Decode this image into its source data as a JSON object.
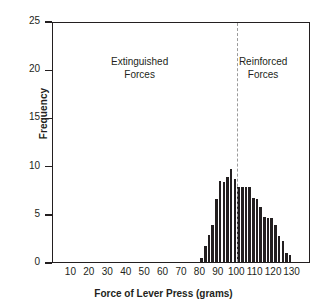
{
  "chart_data": {
    "type": "bar",
    "title": "",
    "xlabel": "Force of Lever Press (grams)",
    "ylabel": "Frequency",
    "xlim": [
      0,
      140
    ],
    "ylim": [
      0,
      25
    ],
    "grid": false,
    "legend": "none",
    "bar_color": "#231f20",
    "x_ticks": [
      10,
      20,
      30,
      40,
      50,
      60,
      70,
      80,
      90,
      100,
      110,
      120,
      130
    ],
    "x_tick_labels": [
      "10",
      "20",
      "30",
      "40",
      "50",
      "60",
      "70",
      "80",
      "90",
      "100",
      "110",
      "120",
      "130"
    ],
    "y_ticks": [
      0,
      5,
      10,
      15,
      20,
      25
    ],
    "y_tick_labels": [
      "0",
      "5",
      "10",
      "15",
      "20",
      "25"
    ],
    "bin_width": 2,
    "x": [
      81,
      83,
      85,
      87,
      89,
      91,
      93,
      95,
      97,
      99,
      101,
      103,
      105,
      107,
      109,
      111,
      113,
      115,
      117,
      119,
      121,
      123,
      125,
      127,
      129,
      131
    ],
    "values": [
      0.4,
      1.7,
      2.8,
      3.8,
      6.5,
      8.4,
      8.3,
      8.8,
      9.7,
      8.6,
      7.8,
      7.8,
      7.8,
      7.8,
      6.6,
      6.5,
      5.7,
      4.7,
      4.6,
      4.6,
      3.8,
      2.7,
      2.2,
      0.9,
      0.7,
      0.0
    ],
    "annotations": [
      {
        "name": "extinguished-forces-label",
        "text": "Extinguished\nForces",
        "x": 47,
        "y": 21
      },
      {
        "name": "reinforced-forces-label",
        "text": "Reinforced\nForces",
        "x": 114,
        "y": 21
      }
    ],
    "reference_line": {
      "name": "reinforcement-threshold",
      "x": 100,
      "style": "dashed",
      "color": "#9b9b9b"
    }
  }
}
